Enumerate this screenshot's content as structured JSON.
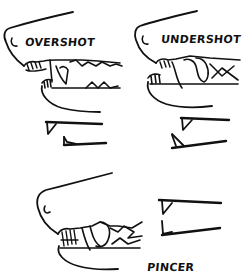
{
  "diagram": {
    "colors": {
      "ink": "#111111",
      "background": "#ffffff"
    },
    "panels": [
      {
        "id": "overshot",
        "label": "OVERSHOT"
      },
      {
        "id": "undershot",
        "label": "UNDERSHOT"
      },
      {
        "id": "pincer",
        "label": "PINCER"
      }
    ]
  }
}
